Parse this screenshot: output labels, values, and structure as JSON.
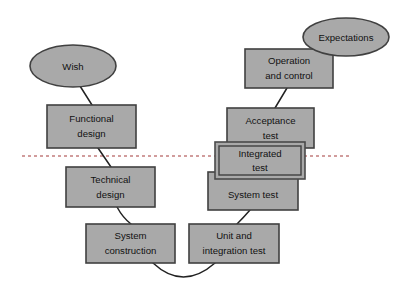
{
  "diagram": {
    "type": "process-diagram",
    "canvas": {
      "width": 418,
      "height": 295,
      "background": "#ffffff"
    },
    "colors": {
      "node_fill": "#a9a9a9",
      "node_stroke": "#404040",
      "connector": "#222222",
      "divider": "#a33b3b",
      "text": "#111111"
    },
    "divider": {
      "name": "abstraction-level-divider",
      "style": "dashed",
      "orientation": "horizontal",
      "y": 156,
      "x_start": 22,
      "x_end": 352,
      "color": "#a33b3b"
    },
    "nodes": [
      {
        "id": "wish",
        "shape": "ellipse",
        "label": "Wish",
        "lines": [
          "Wish"
        ],
        "cx": 73,
        "cy": 66,
        "rx": 43,
        "ry": 21,
        "side": "left"
      },
      {
        "id": "functional-design",
        "shape": "rect",
        "label": "Functional design",
        "lines": [
          "Functional",
          "design"
        ],
        "x": 47,
        "y": 105,
        "width": 89,
        "height": 43,
        "side": "left"
      },
      {
        "id": "technical-design",
        "shape": "rect",
        "label": "Technical design",
        "lines": [
          "Technical",
          "design"
        ],
        "x": 66,
        "y": 167,
        "width": 89,
        "height": 40,
        "side": "left"
      },
      {
        "id": "system-construction",
        "shape": "rect",
        "label": "System construction",
        "lines": [
          "System",
          "construction"
        ],
        "x": 86,
        "y": 224,
        "width": 89,
        "height": 39,
        "side": "left"
      },
      {
        "id": "unit-and-integration-test",
        "shape": "rect",
        "label": "Unit and integration test",
        "lines": [
          "Unit and",
          "integration test"
        ],
        "x": 189,
        "y": 224,
        "width": 90,
        "height": 39,
        "side": "right"
      },
      {
        "id": "system-test",
        "shape": "rect",
        "label": "System test",
        "lines": [
          "System test"
        ],
        "x": 208,
        "y": 172,
        "width": 90,
        "height": 38,
        "side": "right"
      },
      {
        "id": "integrated-test",
        "shape": "rect-double-border",
        "label": "Integrated test",
        "lines": [
          "Integrated",
          "test"
        ],
        "x": 215,
        "y": 142,
        "width": 90,
        "height": 37,
        "side": "right",
        "highlighted": true
      },
      {
        "id": "acceptance-test",
        "shape": "rect",
        "label": "Acceptance test",
        "lines": [
          "Acceptance",
          "test"
        ],
        "x": 227,
        "y": 108,
        "width": 87,
        "height": 40,
        "side": "right"
      },
      {
        "id": "operation-and-control",
        "shape": "rect",
        "label": "Operation and control",
        "lines": [
          "Operation",
          "and control"
        ],
        "x": 245,
        "y": 49,
        "width": 88,
        "height": 39,
        "side": "right"
      },
      {
        "id": "expectations",
        "shape": "ellipse",
        "label": "Expectations",
        "lines": [
          "Expectations"
        ],
        "cx": 346,
        "cy": 37,
        "rx": 43,
        "ry": 19,
        "side": "right"
      }
    ],
    "connectors": [
      {
        "id": "wish-to-functional-design",
        "from": "wish",
        "to": "functional-design",
        "path": "M 80 86 L 92 105"
      },
      {
        "id": "functional-design-to-technical-design",
        "from": "functional-design",
        "to": "technical-design",
        "path": "M 98 148 L 111 167"
      },
      {
        "id": "technical-design-to-system-construction",
        "from": "technical-design",
        "to": "system-construction",
        "path": "M 118 207 Q 124 218 131 224"
      },
      {
        "id": "system-construction-to-unit-test",
        "from": "system-construction",
        "to": "unit-and-integration-test",
        "path": "M 154 263 Q 182 290 214 263"
      },
      {
        "id": "unit-test-to-system-test",
        "from": "unit-and-integration-test",
        "to": "system-test",
        "path": "M 236 224 Q 243 216 249 210"
      },
      {
        "id": "acceptance-test-to-operation",
        "from": "acceptance-test",
        "to": "operation-and-control",
        "path": "M 274 108 L 286 88"
      },
      {
        "id": "operation-to-expectations",
        "from": "operation-and-control",
        "to": "expectations",
        "path": "M 322 49 L 330 44"
      },
      {
        "id": "expectations-tail",
        "from": "expectations",
        "to": "operation-and-control",
        "path": "M 320 51 L 320 54"
      }
    ]
  }
}
